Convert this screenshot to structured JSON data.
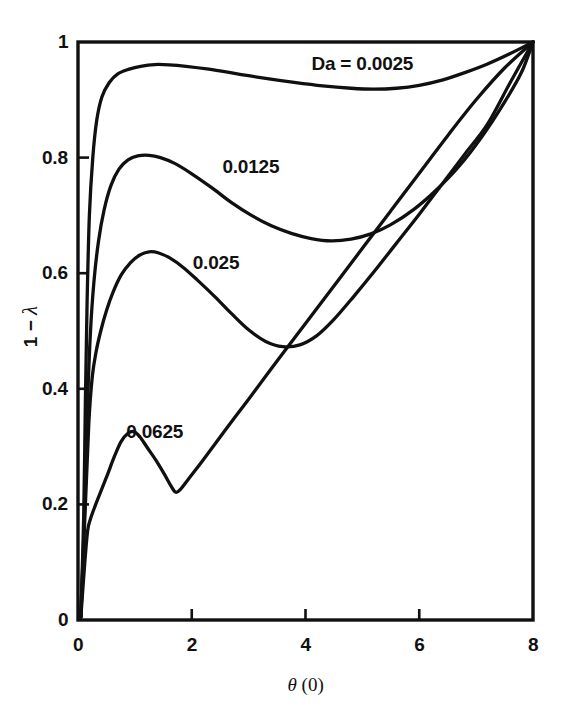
{
  "chart_data": {
    "type": "line",
    "title": "",
    "xlabel": "θ (0)",
    "ylabel": "1 − λ",
    "xlim": [
      0,
      8
    ],
    "ylim": [
      0,
      1
    ],
    "grid": false,
    "legend_position": "inline-curve-labels",
    "x_ticks": [
      {
        "value": 0,
        "label": "0"
      },
      {
        "value": 2,
        "label": "2"
      },
      {
        "value": 4,
        "label": "4"
      },
      {
        "value": 6,
        "label": "6"
      },
      {
        "value": 8,
        "label": "8"
      }
    ],
    "y_ticks": [
      {
        "value": 0,
        "label": "0"
      },
      {
        "value": 0.2,
        "label": "0.2"
      },
      {
        "value": 0.4,
        "label": "0.4"
      },
      {
        "value": 0.6,
        "label": "0.6"
      },
      {
        "value": 0.8,
        "label": "0.8"
      },
      {
        "value": 1,
        "label": "1"
      }
    ],
    "line_color": "#101010",
    "series": [
      {
        "name": "Da = 0.0025",
        "label": "Da = 0.0025",
        "label_x": 5.0,
        "label_y": 0.962,
        "points": [
          [
            0.05,
            0.005
          ],
          [
            0.1,
            0.18
          ],
          [
            0.13,
            0.38
          ],
          [
            0.16,
            0.55
          ],
          [
            0.2,
            0.7
          ],
          [
            0.26,
            0.8
          ],
          [
            0.33,
            0.865
          ],
          [
            0.42,
            0.905
          ],
          [
            0.55,
            0.93
          ],
          [
            0.7,
            0.945
          ],
          [
            0.9,
            0.953
          ],
          [
            1.1,
            0.958
          ],
          [
            1.35,
            0.961
          ],
          [
            1.6,
            0.9605
          ],
          [
            1.9,
            0.958
          ],
          [
            2.3,
            0.953
          ],
          [
            2.8,
            0.945
          ],
          [
            3.3,
            0.937
          ],
          [
            3.8,
            0.93
          ],
          [
            4.3,
            0.924
          ],
          [
            4.8,
            0.92
          ],
          [
            5.2,
            0.9185
          ],
          [
            5.6,
            0.92
          ],
          [
            6.0,
            0.925
          ],
          [
            6.4,
            0.934
          ],
          [
            6.8,
            0.947
          ],
          [
            7.2,
            0.962
          ],
          [
            7.6,
            0.98
          ],
          [
            8.0,
            1.0
          ]
        ]
      },
      {
        "name": "0.0125",
        "label": "0.0125",
        "label_x": 3.04,
        "label_y": 0.783,
        "points": [
          [
            0.05,
            0.005
          ],
          [
            0.12,
            0.2
          ],
          [
            0.17,
            0.38
          ],
          [
            0.22,
            0.5
          ],
          [
            0.28,
            0.585
          ],
          [
            0.36,
            0.655
          ],
          [
            0.46,
            0.71
          ],
          [
            0.58,
            0.752
          ],
          [
            0.72,
            0.78
          ],
          [
            0.88,
            0.796
          ],
          [
            1.05,
            0.803
          ],
          [
            1.25,
            0.804
          ],
          [
            1.45,
            0.8
          ],
          [
            1.7,
            0.79
          ],
          [
            2.0,
            0.772
          ],
          [
            2.35,
            0.748
          ],
          [
            2.7,
            0.722
          ],
          [
            3.05,
            0.7
          ],
          [
            3.4,
            0.682
          ],
          [
            3.75,
            0.669
          ],
          [
            4.1,
            0.66
          ],
          [
            4.45,
            0.656
          ],
          [
            4.8,
            0.659
          ],
          [
            5.15,
            0.668
          ],
          [
            5.5,
            0.684
          ],
          [
            5.9,
            0.71
          ],
          [
            6.3,
            0.744
          ],
          [
            6.7,
            0.785
          ],
          [
            7.1,
            0.836
          ],
          [
            7.5,
            0.896
          ],
          [
            7.8,
            0.948
          ],
          [
            8.0,
            1.0
          ]
        ]
      },
      {
        "name": "0.025",
        "label": "0.025",
        "label_x": 2.43,
        "label_y": 0.617,
        "points": [
          [
            0.05,
            0.005
          ],
          [
            0.13,
            0.2
          ],
          [
            0.19,
            0.34
          ],
          [
            0.25,
            0.42
          ],
          [
            0.32,
            0.465
          ],
          [
            0.4,
            0.5
          ],
          [
            0.5,
            0.535
          ],
          [
            0.62,
            0.568
          ],
          [
            0.76,
            0.597
          ],
          [
            0.92,
            0.618
          ],
          [
            1.08,
            0.631
          ],
          [
            1.25,
            0.637
          ],
          [
            1.42,
            0.635
          ],
          [
            1.62,
            0.626
          ],
          [
            1.85,
            0.61
          ],
          [
            2.1,
            0.588
          ],
          [
            2.4,
            0.56
          ],
          [
            2.7,
            0.53
          ],
          [
            3.0,
            0.502
          ],
          [
            3.3,
            0.482
          ],
          [
            3.6,
            0.473
          ],
          [
            3.9,
            0.476
          ],
          [
            4.2,
            0.492
          ],
          [
            4.5,
            0.52
          ],
          [
            4.85,
            0.56
          ],
          [
            5.2,
            0.602
          ],
          [
            5.6,
            0.652
          ],
          [
            6.0,
            0.702
          ],
          [
            6.4,
            0.754
          ],
          [
            6.8,
            0.806
          ],
          [
            7.2,
            0.858
          ],
          [
            7.6,
            0.93
          ],
          [
            8.0,
            1.0
          ]
        ]
      },
      {
        "name": "0.0625",
        "label": "0.0625",
        "label_x": 1.35,
        "label_y": 0.325,
        "points": [
          [
            0.05,
            0.005
          ],
          [
            0.12,
            0.1
          ],
          [
            0.17,
            0.155
          ],
          [
            0.22,
            0.175
          ],
          [
            0.3,
            0.197
          ],
          [
            0.4,
            0.222
          ],
          [
            0.52,
            0.252
          ],
          [
            0.64,
            0.283
          ],
          [
            0.76,
            0.309
          ],
          [
            0.88,
            0.323
          ],
          [
            0.98,
            0.326
          ],
          [
            1.08,
            0.318
          ],
          [
            1.22,
            0.298
          ],
          [
            1.38,
            0.275
          ],
          [
            1.52,
            0.252
          ],
          [
            1.64,
            0.231
          ],
          [
            1.72,
            0.221
          ],
          [
            1.8,
            0.226
          ],
          [
            1.95,
            0.245
          ],
          [
            2.2,
            0.277
          ],
          [
            2.6,
            0.33
          ],
          [
            3.0,
            0.382
          ],
          [
            3.5,
            0.448
          ],
          [
            4.0,
            0.513
          ],
          [
            4.5,
            0.578
          ],
          [
            5.0,
            0.643
          ],
          [
            5.5,
            0.708
          ],
          [
            6.0,
            0.773
          ],
          [
            6.5,
            0.838
          ],
          [
            7.0,
            0.9
          ],
          [
            7.5,
            0.955
          ],
          [
            8.0,
            1.0
          ]
        ]
      }
    ]
  },
  "axis": {
    "x_title": "θ",
    "x_title_paren": " (0)",
    "y_title_prefix": "1 − ",
    "y_title_symbol": "λ"
  }
}
